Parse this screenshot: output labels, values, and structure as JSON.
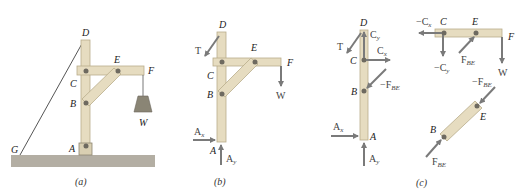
{
  "figure": {
    "colors": {
      "wood": "#e6dcc0",
      "wood_edge": "#b9ad8c",
      "pin": "#6e6a60",
      "arrow": "#7a7a7a",
      "ground": "#b3aea3",
      "text": "#222222"
    },
    "panel_a": {
      "caption": "(a)",
      "points": [
        "D",
        "E",
        "F",
        "C",
        "B",
        "W",
        "G",
        "A"
      ]
    },
    "panel_b": {
      "caption": "(b)",
      "points": [
        "D",
        "E",
        "F",
        "C",
        "B",
        "A"
      ],
      "forces": {
        "T": "T",
        "W": "W",
        "Ax": "A",
        "Ax_sub": "x",
        "Ay": "A",
        "Ay_sub": "y"
      }
    },
    "panel_c": {
      "caption": "(c)",
      "column": {
        "points": [
          "D",
          "C",
          "B",
          "A"
        ],
        "forces": {
          "T": "T",
          "Cy": "C",
          "Cy_sub": "y",
          "Cx": "C",
          "Cx_sub": "x",
          "FBE_neg": "−F",
          "FBE_neg_sub": "BE",
          "Ax": "A",
          "Ax_sub": "x",
          "Ay": "A",
          "Ay_sub": "y"
        }
      },
      "beam": {
        "points": [
          "C",
          "E",
          "F"
        ],
        "forces": {
          "Cx_neg": "−C",
          "Cx_neg_sub": "x",
          "Cy_neg": "−C",
          "Cy_neg_sub": "y",
          "FBE": "F",
          "FBE_sub": "BE",
          "W": "W"
        }
      },
      "strut": {
        "points": [
          "B",
          "E"
        ],
        "forces": {
          "FBE_neg": "−F",
          "FBE_neg_sub": "BE",
          "FBE": "F",
          "FBE_sub": "BE"
        }
      }
    }
  }
}
